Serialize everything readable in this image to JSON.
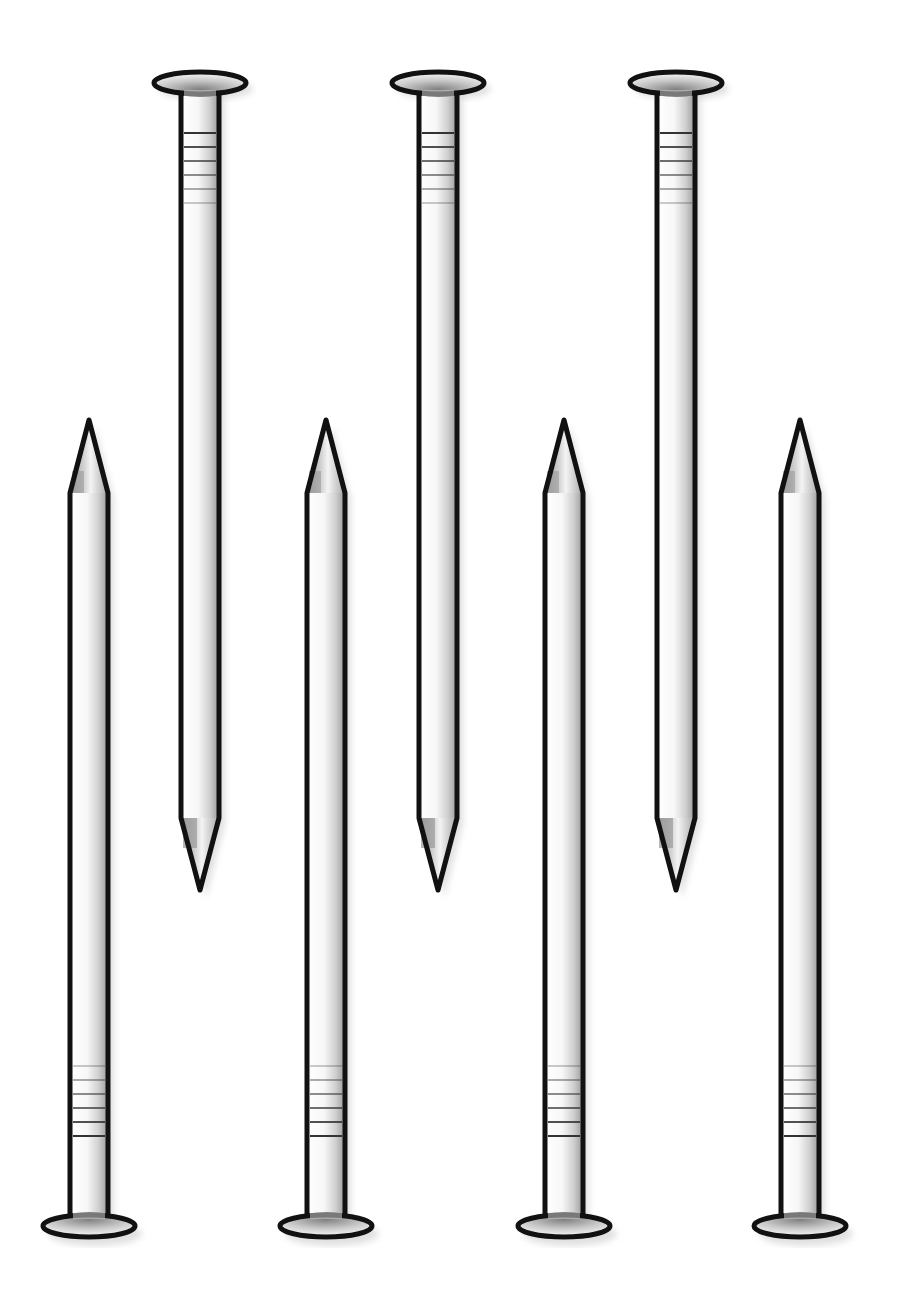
{
  "illustration": {
    "subject": "nails",
    "count": 7,
    "colors": {
      "background": "#ffffff",
      "outline": "#111111",
      "metal_light": "#f4f4f4",
      "metal_mid": "#c8c8c8",
      "metal_dark": "#8a8a8a",
      "shadow": "#d6d6d6"
    },
    "nails": [
      {
        "id": "nail-1",
        "orientation": "head-up",
        "cx": 200,
        "head_y": 83,
        "tip_y": 890
      },
      {
        "id": "nail-2",
        "orientation": "head-up",
        "cx": 438,
        "head_y": 83,
        "tip_y": 890
      },
      {
        "id": "nail-3",
        "orientation": "head-up",
        "cx": 676,
        "head_y": 83,
        "tip_y": 890
      },
      {
        "id": "nail-4",
        "orientation": "head-down",
        "cx": 89,
        "head_y": 1226,
        "tip_y": 420
      },
      {
        "id": "nail-5",
        "orientation": "head-down",
        "cx": 326,
        "head_y": 1226,
        "tip_y": 420
      },
      {
        "id": "nail-6",
        "orientation": "head-down",
        "cx": 564,
        "head_y": 1226,
        "tip_y": 420
      },
      {
        "id": "nail-7",
        "orientation": "head-down",
        "cx": 800,
        "head_y": 1226,
        "tip_y": 420
      }
    ]
  }
}
